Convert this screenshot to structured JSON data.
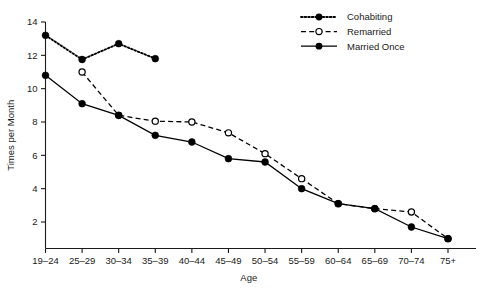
{
  "chart_data": {
    "type": "line",
    "title": "",
    "xlabel": "Age",
    "ylabel": "Times per Month",
    "categories": [
      "19–24",
      "25–29",
      "30–34",
      "35–39",
      "40–44",
      "45–49",
      "50–54",
      "55–59",
      "60–64",
      "65–69",
      "70–74",
      "75+"
    ],
    "ylim": [
      0.4,
      14.4
    ],
    "yticks": [
      2,
      4,
      6,
      8,
      10,
      12,
      14
    ],
    "ytick_labels": [
      "2",
      "4",
      "6",
      "8",
      "10",
      "12",
      "14"
    ],
    "grid": false,
    "legend_position": "top-right",
    "series": [
      {
        "name": "Cohabiting",
        "marker": "filled-circle",
        "line_style": "dotted",
        "color": "#000000",
        "values": [
          13.2,
          11.75,
          12.7,
          11.8,
          null,
          null,
          null,
          null,
          null,
          null,
          null,
          null
        ]
      },
      {
        "name": "Remarried",
        "marker": "open-circle",
        "line_style": "dashed",
        "color": "#000000",
        "values": [
          null,
          11.0,
          8.4,
          8.05,
          8.0,
          7.35,
          6.1,
          4.6,
          3.1,
          2.8,
          2.6,
          1.0
        ]
      },
      {
        "name": "Married Once",
        "marker": "filled-circle",
        "line_style": "solid",
        "color": "#000000",
        "values": [
          10.8,
          9.1,
          8.4,
          7.2,
          6.8,
          5.8,
          5.6,
          4.0,
          3.1,
          2.8,
          1.7,
          1.0
        ]
      }
    ]
  },
  "legend": {
    "items": [
      {
        "label": "Cohabiting",
        "style": "dotted-filled"
      },
      {
        "label": "Remarried",
        "style": "dashed-open"
      },
      {
        "label": "Married Once",
        "style": "solid-filled"
      }
    ]
  },
  "axes": {
    "x_title": "Age",
    "y_title": "Times per Month"
  }
}
